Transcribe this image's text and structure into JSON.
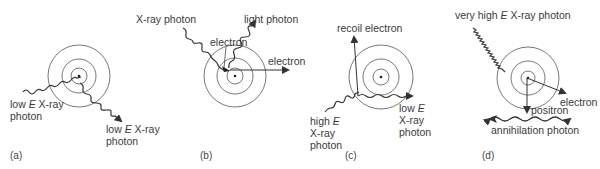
{
  "figure": {
    "panels": [
      {
        "tag": "(a)",
        "name": "coherent-scattering",
        "labels": {
          "incoming_pre": "low ",
          "incoming_E": "E",
          "incoming_post": " X-ray",
          "incoming_line2": "photon",
          "outgoing_pre": "low ",
          "outgoing_E": "E",
          "outgoing_post": " X-ray",
          "outgoing_line2": "photon"
        }
      },
      {
        "tag": "(b)",
        "name": "photoelectric-effect",
        "labels": {
          "incoming": "X-ray photon",
          "emitted": "light photon",
          "inner_electron": "electron",
          "ejected_electron": "electron"
        }
      },
      {
        "tag": "(c)",
        "name": "compton-scattering",
        "labels": {
          "recoil": "recoil electron",
          "incoming_pre": "high ",
          "incoming_E": "E",
          "incoming_line2": "X-ray",
          "incoming_line3": "photon",
          "outgoing_pre": "low ",
          "outgoing_E": "E",
          "outgoing_line2": "X-ray",
          "outgoing_line3": "photon"
        }
      },
      {
        "tag": "(d)",
        "name": "pair-production",
        "labels": {
          "incoming_pre": "very high ",
          "incoming_E": "E",
          "incoming_post": " X-ray photon",
          "electron": "electron",
          "positron": "positron",
          "annihilation": "annihilation photon"
        }
      }
    ]
  }
}
